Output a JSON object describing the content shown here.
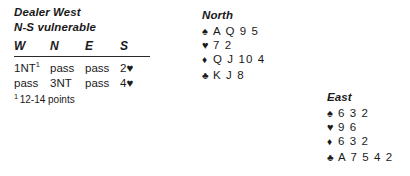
{
  "deal": {
    "dealer_line": "Dealer West",
    "vulnerable_line": "N-S vulnerable"
  },
  "auction": {
    "headers": [
      "W",
      "N",
      "E",
      "S"
    ],
    "rows": [
      [
        "1NT",
        "pass",
        "pass",
        "2♥"
      ],
      [
        "pass",
        "3NT",
        "pass",
        "4♥"
      ]
    ],
    "footnote_marker": "1",
    "footnote_text": "12-14 points",
    "first_bid_superscript": "1"
  },
  "hands": [
    {
      "label": "North",
      "suits": [
        {
          "symbol": "♠",
          "name": "spade-symbol",
          "cards": "A Q 9 5"
        },
        {
          "symbol": "♥",
          "name": "heart-symbol",
          "cards": "7 2"
        },
        {
          "symbol": "♦",
          "name": "diamond-symbol",
          "cards": "Q J 10 4"
        },
        {
          "symbol": "♣",
          "name": "club-symbol",
          "cards": "K J 8"
        }
      ]
    },
    {
      "label": "East",
      "suits": [
        {
          "symbol": "♠",
          "name": "spade-symbol",
          "cards": "6 3 2"
        },
        {
          "symbol": "♥",
          "name": "heart-symbol",
          "cards": "9 6"
        },
        {
          "symbol": "♦",
          "name": "diamond-symbol",
          "cards": "6 3 2"
        },
        {
          "symbol": "♣",
          "name": "club-symbol",
          "cards": "A 7 5 4 2"
        }
      ]
    }
  ],
  "colors": {
    "text": "#1a1a1a",
    "background": "#ffffff",
    "rule": "#2b2b2b"
  }
}
